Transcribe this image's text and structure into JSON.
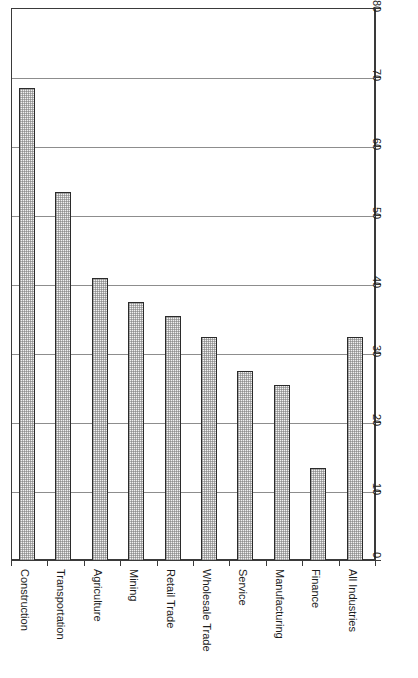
{
  "chart_data": {
    "type": "bar",
    "title": "",
    "subtitle": "",
    "xlabel": "",
    "ylabel": "",
    "orientation": "vertical",
    "grid": true,
    "legend": false,
    "legend_position": "none",
    "value_axis_position": "right",
    "category_label_rotation": 90,
    "value_label_rotation": 90,
    "ylim": [
      0,
      80
    ],
    "ytick_step": 10,
    "ticks": [
      "0",
      "10",
      "20",
      "30",
      "40",
      "50",
      "60",
      "70",
      "80"
    ],
    "categories": [
      "Construction",
      "Transportation",
      "Agriculture",
      "Mining",
      "Retail Trade",
      "Wholesale Trade",
      "Service",
      "Manufacturing",
      "Finance",
      "All Industries"
    ],
    "values": [
      68.5,
      53.5,
      41,
      37.5,
      35.5,
      32.5,
      27.5,
      25.5,
      13.5,
      32.5
    ],
    "bar_fill_color": "#f1f1f1",
    "bar_edge_color": "#2b2b2b",
    "grid_color": "#8d8d8d",
    "frame_color": "#3a3a3a",
    "background_color": "#ffffff"
  }
}
